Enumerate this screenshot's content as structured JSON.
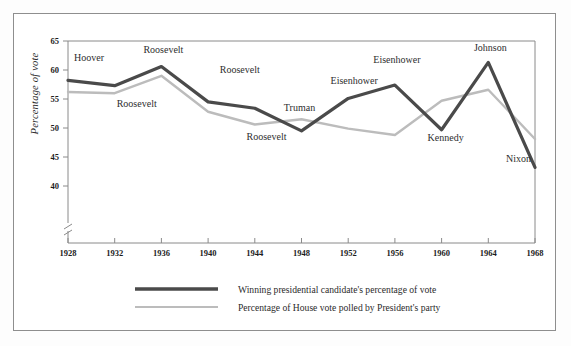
{
  "chart_data": {
    "type": "line",
    "title": "",
    "subtitle": "",
    "xlabel": "",
    "ylabel": "Percentage of vote",
    "x": [
      1928,
      1932,
      1936,
      1940,
      1944,
      1948,
      1952,
      1956,
      1960,
      1964,
      1968
    ],
    "xtick_labels": [
      "1928",
      "1932",
      "1936",
      "1940",
      "1944",
      "1948",
      "1952",
      "1956",
      "1960",
      "1964",
      "1968"
    ],
    "ytick_labels": [
      "40",
      "45",
      "50",
      "55",
      "60",
      "65"
    ],
    "ytick_values": [
      40,
      45,
      50,
      55,
      60,
      65
    ],
    "ylim": [
      40,
      65
    ],
    "xlim": [
      1928,
      1968
    ],
    "y_axis_break": true,
    "grid": false,
    "legend_position": "bottom-center",
    "series": [
      {
        "name": "Winning presidential candidate's percentage of vote",
        "color": "#4a4a4a",
        "width": 3.2,
        "values": [
          58.2,
          57.3,
          60.6,
          54.5,
          53.4,
          49.5,
          55.1,
          57.4,
          49.7,
          61.3,
          43.2
        ]
      },
      {
        "name": "Percentage of House vote polled by President's party",
        "color": "#bcbcbc",
        "width": 2.4,
        "values": [
          56.2,
          56.0,
          59.0,
          52.8,
          50.6,
          51.5,
          49.9,
          48.8,
          54.7,
          56.6,
          48.1
        ]
      }
    ],
    "annotations": [
      {
        "text": "Hoover",
        "x": 1928,
        "y": 61.6,
        "anchor": "start",
        "dx": 6,
        "dy": 0
      },
      {
        "text": "Roosevelt",
        "x": 1932,
        "y": 53.6,
        "anchor": "start",
        "dx": 2,
        "dy": 0
      },
      {
        "text": "Roosevelt",
        "x": 1936,
        "y": 63.0,
        "anchor": "middle",
        "dx": 2,
        "dy": 0
      },
      {
        "text": "Roosevelt",
        "x": 1941,
        "y": 59.4,
        "anchor": "start",
        "dx": 0,
        "dy": 0
      },
      {
        "text": "Roosevelt",
        "x": 1945,
        "y": 47.9,
        "anchor": "middle",
        "dx": 0,
        "dy": 0
      },
      {
        "text": "Truman",
        "x": 1948,
        "y": 53.0,
        "anchor": "middle",
        "dx": -2,
        "dy": 0
      },
      {
        "text": "Eisenhower",
        "x": 1952,
        "y": 57.6,
        "anchor": "middle",
        "dx": 6,
        "dy": 0
      },
      {
        "text": "Eisenhower",
        "x": 1956,
        "y": 61.2,
        "anchor": "middle",
        "dx": 2,
        "dy": 0
      },
      {
        "text": "Kennedy",
        "x": 1960,
        "y": 47.7,
        "anchor": "middle",
        "dx": 4,
        "dy": 0
      },
      {
        "text": "Johnson",
        "x": 1964,
        "y": 63.3,
        "anchor": "middle",
        "dx": 2,
        "dy": 0
      },
      {
        "text": "Nixon",
        "x": 1968,
        "y": 44.2,
        "anchor": "end",
        "dx": -4,
        "dy": 0
      }
    ]
  },
  "legend": {
    "items": [
      {
        "label": "Winning presidential candidate's percentage of vote"
      },
      {
        "label": "Percentage of House vote polled by President's party"
      }
    ]
  },
  "colors": {
    "series_dark": "#4a4a4a",
    "series_light": "#bcbcbc",
    "axis": "#8a8a8a",
    "text": "#2b2b2b",
    "frame": "#8e8e8e"
  }
}
